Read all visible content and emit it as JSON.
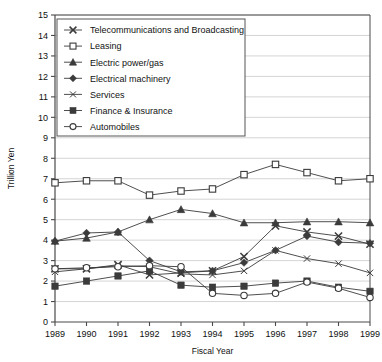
{
  "chart_data": {
    "type": "line",
    "title": "",
    "xlabel": "Fiscal Year",
    "ylabel": "Trillion Yen",
    "xlim": [
      1989,
      1999
    ],
    "ylim": [
      0,
      15
    ],
    "ytick_step": 1,
    "grid": true,
    "legend_position": "upper-left-inside",
    "categories": [
      "1989",
      "1990",
      "1991",
      "1992",
      "1993",
      "1994",
      "1995",
      "1996",
      "1997",
      "1998",
      "1999"
    ],
    "x": [
      1989,
      1990,
      1991,
      1992,
      1993,
      1994,
      1995,
      1996,
      1997,
      1998,
      1999
    ],
    "series": [
      {
        "name": "Telecommunications and Broadcasting",
        "marker": "x-cross",
        "values": [
          2.6,
          2.6,
          2.8,
          2.3,
          2.4,
          2.5,
          3.2,
          4.7,
          4.4,
          4.2,
          3.8
        ]
      },
      {
        "name": "Leasing",
        "marker": "open-square",
        "values": [
          6.8,
          6.9,
          6.9,
          6.2,
          6.4,
          6.5,
          7.2,
          7.7,
          7.3,
          6.9,
          7.0
        ]
      },
      {
        "name": "Electric power/gas",
        "marker": "filled-triangle",
        "values": [
          3.95,
          4.1,
          4.4,
          5.0,
          5.5,
          5.3,
          4.85,
          4.85,
          4.9,
          4.9,
          4.85
        ]
      },
      {
        "name": "Electrical machinery",
        "marker": "filled-diamond",
        "values": [
          3.95,
          4.35,
          4.4,
          3.0,
          2.45,
          2.5,
          2.9,
          3.5,
          4.2,
          3.9,
          3.85
        ]
      },
      {
        "name": "Services",
        "marker": "x-thin",
        "values": [
          2.45,
          2.6,
          2.75,
          2.7,
          2.35,
          2.3,
          2.5,
          3.5,
          3.1,
          2.85,
          2.4
        ]
      },
      {
        "name": "Finance & Insurance",
        "marker": "filled-square",
        "values": [
          1.75,
          2.0,
          2.25,
          2.5,
          1.8,
          1.7,
          1.75,
          1.9,
          2.0,
          1.7,
          1.5
        ]
      },
      {
        "name": "Automobiles",
        "marker": "open-circle",
        "values": [
          2.6,
          2.65,
          2.7,
          2.75,
          2.7,
          1.4,
          1.3,
          1.4,
          1.95,
          1.65,
          1.2
        ]
      }
    ],
    "ytick_labels": [
      "0",
      "1",
      "2",
      "3",
      "4",
      "5",
      "6",
      "7",
      "8",
      "9",
      "10",
      "11",
      "12",
      "13",
      "14",
      "15"
    ]
  },
  "axes": {
    "ylabel": "Trillion Yen",
    "xlabel": "Fiscal Year"
  },
  "legend": {
    "items": [
      {
        "label": "Telecommunications and Broadcasting",
        "marker": "x-cross"
      },
      {
        "label": "Leasing",
        "marker": "open-square"
      },
      {
        "label": "Electric power/gas",
        "marker": "filled-triangle"
      },
      {
        "label": "Electrical machinery",
        "marker": "filled-diamond"
      },
      {
        "label": "Services",
        "marker": "x-thin"
      },
      {
        "label": "Finance & Insurance",
        "marker": "filled-square"
      },
      {
        "label": "Automobiles",
        "marker": "open-circle"
      }
    ]
  },
  "colors": {
    "line": "#3b3b3b",
    "grid": "#c9c9c9",
    "axis": "#4a4a4a",
    "text": "#111111",
    "legend_bg": "#ffffff",
    "legend_border": "#555555"
  }
}
